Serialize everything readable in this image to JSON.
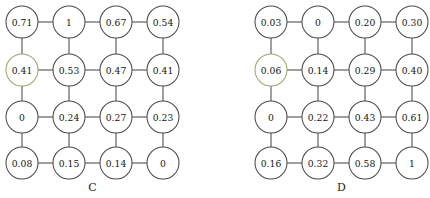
{
  "figure": {
    "type": "node-grid-diagram",
    "background_color": "#ffffff",
    "edge_color": "#4a4a4a",
    "node_fill_color": "#ffffff",
    "node_stroke_color": "#4a4a4a",
    "node_accent_stroke_color": "#9aa86a"
  },
  "chart_data": {
    "type": "heatmap",
    "title": "",
    "xlabel": "",
    "ylabel": "",
    "layout": "4x4 grid of circular nodes connected by horizontal and vertical edges",
    "panels": [
      {
        "label": "C",
        "rows": [
          [
            "0.71",
            "1",
            "0.67",
            "0.54"
          ],
          [
            "0.41",
            "0.53",
            "0.47",
            "0.41"
          ],
          [
            "0",
            "0.24",
            "0.27",
            "0.23"
          ],
          [
            "0.08",
            "0.15",
            "0.14",
            "0"
          ]
        ],
        "values": [
          [
            0.71,
            1,
            0.67,
            0.54
          ],
          [
            0.41,
            0.53,
            0.47,
            0.41
          ],
          [
            0,
            0.24,
            0.27,
            0.23
          ],
          [
            0.08,
            0.15,
            0.14,
            0
          ]
        ],
        "accent_nodes": [
          [
            1,
            0
          ]
        ]
      },
      {
        "label": "D",
        "rows": [
          [
            "0.03",
            "0",
            "0.20",
            "0.30"
          ],
          [
            "0.06",
            "0.14",
            "0.29",
            "0.40"
          ],
          [
            "0",
            "0.22",
            "0.43",
            "0.61"
          ],
          [
            "0.16",
            "0.32",
            "0.58",
            "1"
          ]
        ],
        "values": [
          [
            0.03,
            0,
            0.2,
            0.3
          ],
          [
            0.06,
            0.14,
            0.29,
            0.4
          ],
          [
            0,
            0.22,
            0.43,
            0.61
          ],
          [
            0.16,
            0.32,
            0.58,
            1
          ]
        ],
        "accent_nodes": [
          [
            1,
            0
          ]
        ]
      }
    ]
  },
  "geometry": {
    "panel_origins_x": [
      0,
      249
    ],
    "col_centers": [
      22,
      69,
      116,
      163
    ],
    "row_centers": [
      22,
      70,
      117,
      163
    ],
    "node_radius": 16,
    "label_y": 181
  }
}
